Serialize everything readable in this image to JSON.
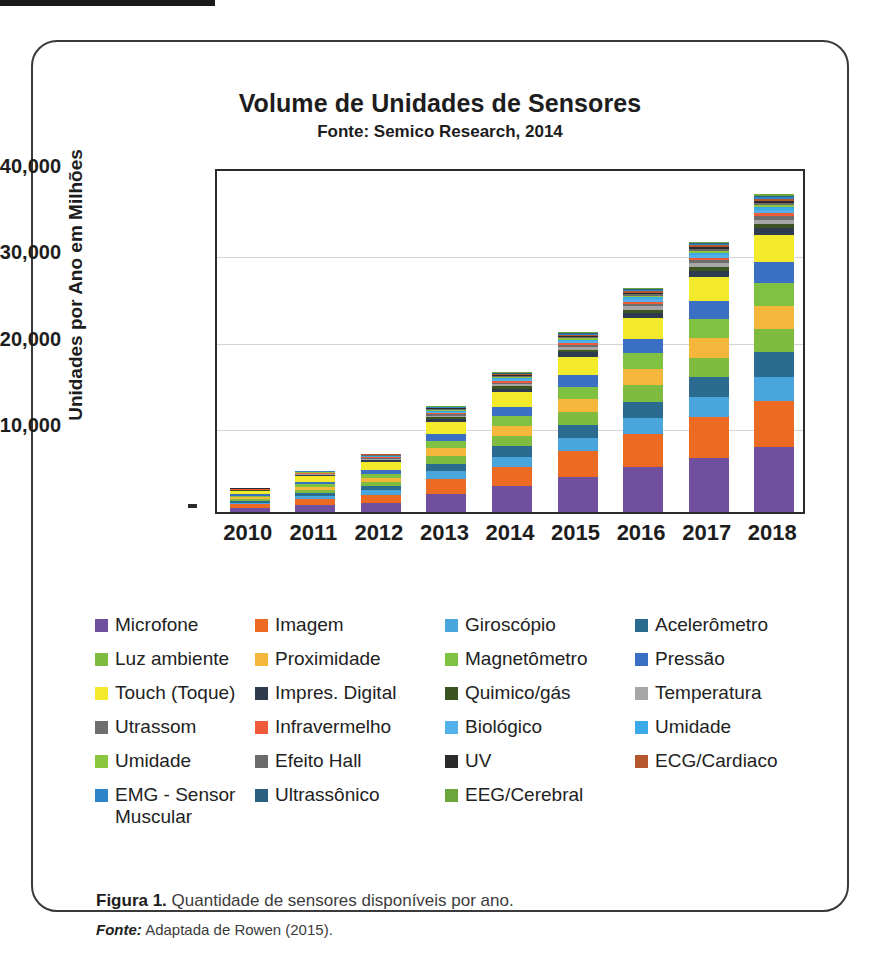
{
  "figure": {
    "caption_bold": "Figura 1.",
    "caption_text": " Quantidade de sensores disponíveis por ano.",
    "source_bold": "Fonte:",
    "source_text": " Adaptada de Rowen (2015)."
  },
  "chart_data": {
    "type": "bar",
    "stacked": true,
    "title": "Volume de Unidades de Sensores",
    "subtitle": "Fonte: Semico Research, 2014",
    "xlabel": "",
    "ylabel": "Unidades por Ano em Milhões",
    "ylim": [
      0,
      40000
    ],
    "yticks": [
      "10,000",
      "20,000",
      "30,000",
      "40,000"
    ],
    "ytick_values": [
      10000,
      20000,
      30000,
      40000
    ],
    "grid": true,
    "legend_position": "bottom",
    "categories": [
      "2010",
      "2011",
      "2012",
      "2013",
      "2014",
      "2015",
      "2016",
      "2017",
      "2018"
    ],
    "totals": [
      2700,
      4600,
      6500,
      11700,
      15000,
      19300,
      24000,
      30000,
      37300
    ],
    "series": [
      {
        "name": "Microfone",
        "color": "#6f4f9e",
        "values": [
          500,
          800,
          1100,
          2100,
          3000,
          4100,
          5200,
          6300,
          7500
        ]
      },
      {
        "name": "Imagem",
        "color": "#ec6a22",
        "values": [
          400,
          700,
          900,
          1700,
          2200,
          3000,
          3800,
          4700,
          5400
        ]
      },
      {
        "name": "Giroscópio",
        "color": "#4aa5dd",
        "values": [
          200,
          350,
          500,
          900,
          1200,
          1500,
          1900,
          2300,
          2800
        ]
      },
      {
        "name": "Acelerômetro",
        "color": "#2a6b8f",
        "values": [
          200,
          350,
          500,
          900,
          1200,
          1500,
          1900,
          2300,
          2800
        ]
      },
      {
        "name": "Luz ambiente",
        "color": "#7fbb3e",
        "values": [
          200,
          350,
          500,
          900,
          1200,
          1500,
          1900,
          2300,
          2700
        ]
      },
      {
        "name": "Proximidade",
        "color": "#f5b63c",
        "values": [
          200,
          350,
          500,
          900,
          1200,
          1500,
          1900,
          2300,
          2700
        ]
      },
      {
        "name": "Magnetômetro",
        "color": "#7fc241",
        "values": [
          200,
          300,
          450,
          800,
          1100,
          1400,
          1800,
          2200,
          2600
        ]
      },
      {
        "name": "Pressão",
        "color": "#3a6fc4",
        "values": [
          200,
          300,
          450,
          800,
          1100,
          1400,
          1700,
          2100,
          2500
        ]
      },
      {
        "name": "Touch (Toque)",
        "color": "#f2ea2a",
        "values": [
          350,
          650,
          900,
          1500,
          1700,
          2100,
          2400,
          2800,
          3100
        ]
      },
      {
        "name": "Impres. Digital",
        "color": "#2e3a4d",
        "values": [
          50,
          100,
          180,
          300,
          400,
          500,
          600,
          700,
          800
        ]
      },
      {
        "name": "Quimico/gás",
        "color": "#3c5421",
        "values": [
          40,
          70,
          110,
          200,
          260,
          320,
          380,
          440,
          500
        ]
      },
      {
        "name": "Temperatura",
        "color": "#a6a6a6",
        "values": [
          40,
          70,
          110,
          200,
          260,
          320,
          380,
          440,
          500
        ]
      },
      {
        "name": "Utrassom",
        "color": "#6e6e6e",
        "values": [
          30,
          50,
          80,
          150,
          190,
          230,
          280,
          320,
          380
        ]
      },
      {
        "name": "Infravermelho",
        "color": "#ef5a3a",
        "values": [
          30,
          50,
          80,
          150,
          190,
          230,
          280,
          320,
          380
        ]
      },
      {
        "name": "Biológico",
        "color": "#51b1e8",
        "values": [
          30,
          50,
          80,
          140,
          180,
          220,
          260,
          310,
          360
        ]
      },
      {
        "name": "Umidade",
        "color": "#39a9e8",
        "values": [
          20,
          40,
          60,
          110,
          140,
          180,
          220,
          260,
          300
        ]
      },
      {
        "name": "Umidade",
        "color": "#8cc63f",
        "values": [
          20,
          40,
          60,
          100,
          130,
          160,
          200,
          240,
          280
        ]
      },
      {
        "name": "Efeito Hall",
        "color": "#6b6b6b",
        "values": [
          20,
          30,
          50,
          90,
          120,
          150,
          180,
          220,
          260
        ]
      },
      {
        "name": "UV",
        "color": "#2b2b2b",
        "values": [
          20,
          30,
          50,
          90,
          110,
          140,
          170,
          210,
          250
        ]
      },
      {
        "name": "ECG/Cardiaco",
        "color": "#b4562e",
        "values": [
          10,
          20,
          40,
          70,
          90,
          110,
          140,
          170,
          200
        ]
      },
      {
        "name": "EMG - Sensor\nMuscular",
        "color": "#2d84c8",
        "values": [
          10,
          20,
          30,
          60,
          80,
          100,
          120,
          150,
          180
        ]
      },
      {
        "name": "Ultrassônico",
        "color": "#2a5f80",
        "values": [
          10,
          20,
          30,
          60,
          80,
          100,
          120,
          150,
          180
        ]
      },
      {
        "name": "EEG/Cerebral",
        "color": "#6aa63c",
        "values": [
          10,
          20,
          30,
          50,
          70,
          90,
          110,
          140,
          160
        ]
      }
    ]
  },
  "legend": {
    "columns": [
      [
        {
          "label": "Microfone",
          "color": "#6f4f9e"
        },
        {
          "label": "Luz ambiente",
          "color": "#7fbb3e"
        },
        {
          "label": "Touch (Toque)",
          "color": "#f2ea2a"
        },
        {
          "label": "Utrassom",
          "color": "#6e6e6e"
        },
        {
          "label": "Umidade",
          "color": "#8cc63f"
        },
        {
          "label": "EMG - Sensor\nMuscular",
          "color": "#2d84c8"
        }
      ],
      [
        {
          "label": "Imagem",
          "color": "#ec6a22"
        },
        {
          "label": "Proximidade",
          "color": "#f5b63c"
        },
        {
          "label": "Impres. Digital",
          "color": "#2e3a4d"
        },
        {
          "label": "Infravermelho",
          "color": "#ef5a3a"
        },
        {
          "label": "Efeito Hall",
          "color": "#6b6b6b"
        },
        {
          "label": "Ultrassônico",
          "color": "#2a5f80"
        }
      ],
      [
        {
          "label": "Giroscópio",
          "color": "#4aa5dd"
        },
        {
          "label": "Magnetômetro",
          "color": "#7fc241"
        },
        {
          "label": "Quimico/gás",
          "color": "#3c5421"
        },
        {
          "label": "Biológico",
          "color": "#51b1e8"
        },
        {
          "label": "UV",
          "color": "#2b2b2b"
        },
        {
          "label": "EEG/Cerebral",
          "color": "#6aa63c"
        }
      ],
      [
        {
          "label": "Acelerômetro",
          "color": "#2a6b8f"
        },
        {
          "label": "Pressão",
          "color": "#3a6fc4"
        },
        {
          "label": "Temperatura",
          "color": "#a6a6a6"
        },
        {
          "label": "Umidade",
          "color": "#39a9e8"
        },
        {
          "label": "ECG/Cardiaco",
          "color": "#b4562e"
        }
      ]
    ]
  }
}
